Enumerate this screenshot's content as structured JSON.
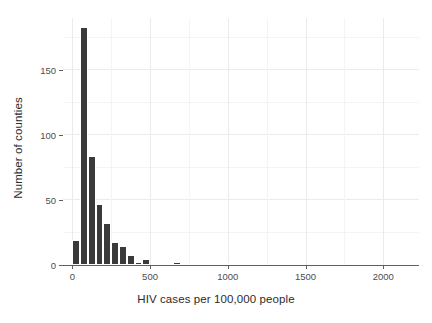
{
  "chart_data": {
    "type": "bar",
    "title": "",
    "subtitle": "",
    "xlabel": "HIV cases per 100,000 people",
    "ylabel": "Number of counties",
    "xlim": [
      -60,
      2230
    ],
    "ylim": [
      0,
      190
    ],
    "grid": true,
    "legend": null,
    "bin_width": 50,
    "x_ticks": [
      {
        "value": 0,
        "label": "0"
      },
      {
        "value": 500,
        "label": "500"
      },
      {
        "value": 1000,
        "label": "1000"
      },
      {
        "value": 1500,
        "label": "1500"
      },
      {
        "value": 2000,
        "label": "2000"
      }
    ],
    "y_ticks": [
      {
        "value": 0,
        "label": "0"
      },
      {
        "value": 50,
        "label": "50"
      },
      {
        "value": 100,
        "label": "100"
      },
      {
        "value": 150,
        "label": "150"
      }
    ],
    "bars": [
      {
        "bin_start": 0,
        "bin_end": 50,
        "value": 19
      },
      {
        "bin_start": 50,
        "bin_end": 100,
        "value": 183
      },
      {
        "bin_start": 100,
        "bin_end": 150,
        "value": 84
      },
      {
        "bin_start": 150,
        "bin_end": 200,
        "value": 47
      },
      {
        "bin_start": 200,
        "bin_end": 250,
        "value": 32
      },
      {
        "bin_start": 250,
        "bin_end": 300,
        "value": 18
      },
      {
        "bin_start": 300,
        "bin_end": 350,
        "value": 15
      },
      {
        "bin_start": 350,
        "bin_end": 400,
        "value": 8
      },
      {
        "bin_start": 400,
        "bin_end": 450,
        "value": 2
      },
      {
        "bin_start": 450,
        "bin_end": 500,
        "value": 5
      },
      {
        "bin_start": 650,
        "bin_end": 700,
        "value": 2
      },
      {
        "bin_start": 700,
        "bin_end": 750,
        "value": 1
      },
      {
        "bin_start": 750,
        "bin_end": 800,
        "value": 1
      },
      {
        "bin_start": 800,
        "bin_end": 850,
        "value": 1
      },
      {
        "bin_start": 850,
        "bin_end": 900,
        "value": 1
      },
      {
        "bin_start": 1000,
        "bin_end": 1050,
        "value": 1
      },
      {
        "bin_start": 1100,
        "bin_end": 1150,
        "value": 1
      },
      {
        "bin_start": 2100,
        "bin_end": 2150,
        "value": 1
      }
    ],
    "bar_color": "#3a3a3a",
    "background_color": "#ffffff",
    "grid_color": "#ebebeb",
    "axis_color": "#5f5f5f",
    "text_color": "#2b2b2b"
  }
}
